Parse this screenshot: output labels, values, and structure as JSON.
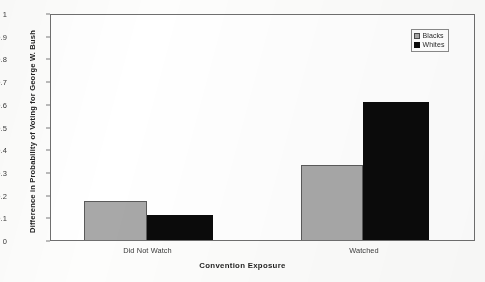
{
  "chart_data": {
    "type": "bar",
    "title": "",
    "xlabel": "Convention Exposure",
    "ylabel": "Difference in Probability of Voting for George W. Bush",
    "categories": [
      "Did Not Watch",
      "Watched"
    ],
    "series": [
      {
        "name": "Blacks",
        "color": "#a8a8a8",
        "values": [
          0.17,
          0.33
        ]
      },
      {
        "name": "Whites",
        "color": "#0b0b0b",
        "values": [
          0.11,
          0.61
        ]
      }
    ],
    "ylim": [
      0,
      1
    ],
    "ytick_step": 0.1,
    "yticks": [
      "0",
      "0.1",
      "0.2",
      "0.3",
      "0.4",
      "0.5",
      "0.6",
      "0.7",
      "0.8",
      "0.9",
      "1"
    ],
    "grid": false,
    "legend_position": "top-right"
  }
}
